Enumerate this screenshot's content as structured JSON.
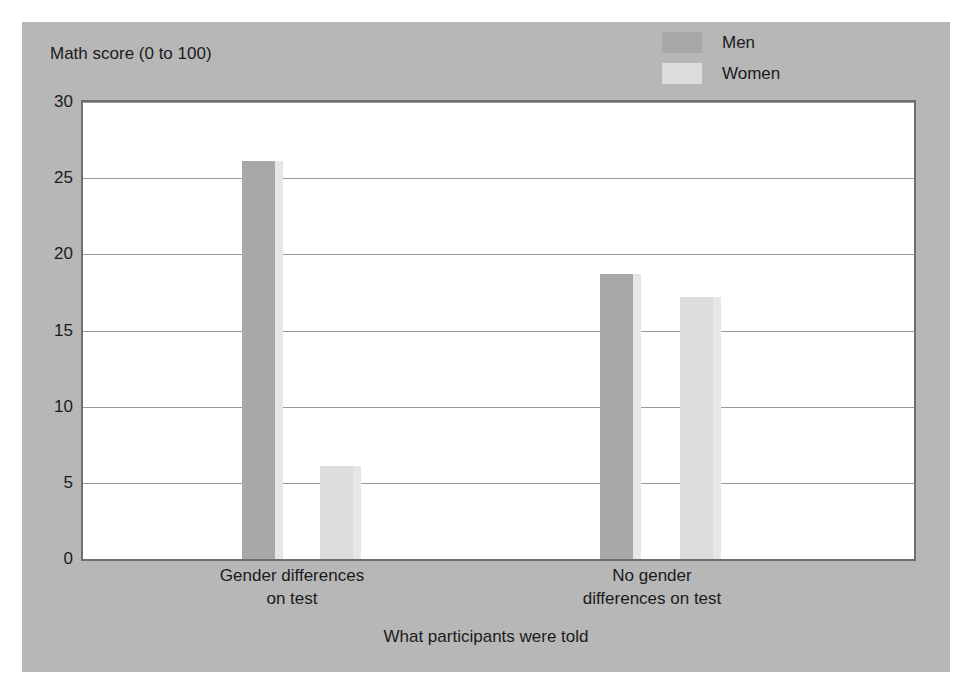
{
  "chart_data": {
    "type": "bar",
    "title": "",
    "subtitle": "",
    "xlabel": "What participants were told",
    "ylabel": "Math score (0 to 100)",
    "categories": [
      "Gender differences on test",
      "No gender differences on test"
    ],
    "category_lines": [
      [
        "Gender differences",
        "on test"
      ],
      [
        "No gender",
        "differences on test"
      ]
    ],
    "series": [
      {
        "name": "Men",
        "color": "#a8a8a8",
        "values": [
          26.1,
          18.7
        ]
      },
      {
        "name": "Women",
        "color": "#dcdcdc",
        "values": [
          6.1,
          17.2
        ]
      }
    ],
    "ylim": [
      0,
      30
    ],
    "ytick_labels": [
      "0",
      "5",
      "10",
      "15",
      "20",
      "25",
      "30"
    ],
    "ytick_values": [
      0,
      5,
      10,
      15,
      20,
      25,
      30
    ],
    "grid": true,
    "legend_position": "top-right",
    "colors": {
      "panel_background": "#b7b7b7",
      "plot_background": "#ffffff",
      "frame": "#6f6f6f",
      "gridline": "#9a9a9a",
      "text": "#1b1b1b",
      "bar_shadow": "#e6e6e6"
    }
  }
}
